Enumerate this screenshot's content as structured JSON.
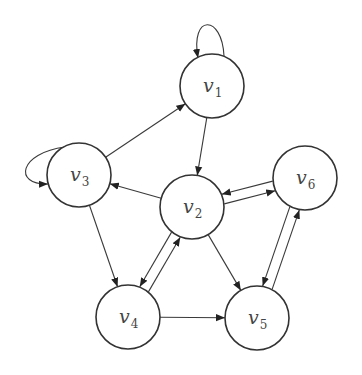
{
  "diagram": {
    "type": "directed-graph",
    "node_radius": 32,
    "nodes": [
      {
        "id": "v1",
        "base": "v",
        "sub": "1",
        "x": 212,
        "y": 86
      },
      {
        "id": "v2",
        "base": "v",
        "sub": "2",
        "x": 192,
        "y": 207
      },
      {
        "id": "v3",
        "base": "v",
        "sub": "3",
        "x": 79,
        "y": 175
      },
      {
        "id": "v4",
        "base": "v",
        "sub": "4",
        "x": 128,
        "y": 317
      },
      {
        "id": "v5",
        "base": "v",
        "sub": "5",
        "x": 257,
        "y": 318
      },
      {
        "id": "v6",
        "base": "v",
        "sub": "6",
        "x": 305,
        "y": 178
      }
    ],
    "edges": [
      {
        "from": "v1",
        "to": "v1",
        "self_loop": true
      },
      {
        "from": "v3",
        "to": "v3",
        "self_loop": true
      },
      {
        "from": "v3",
        "to": "v1"
      },
      {
        "from": "v1",
        "to": "v2"
      },
      {
        "from": "v2",
        "to": "v3"
      },
      {
        "from": "v3",
        "to": "v4"
      },
      {
        "from": "v2",
        "to": "v6"
      },
      {
        "from": "v6",
        "to": "v2"
      },
      {
        "from": "v4",
        "to": "v2"
      },
      {
        "from": "v2",
        "to": "v4"
      },
      {
        "from": "v2",
        "to": "v5"
      },
      {
        "from": "v4",
        "to": "v5"
      },
      {
        "from": "v5",
        "to": "v6"
      },
      {
        "from": "v6",
        "to": "v5"
      }
    ],
    "colors": {
      "stroke": "#333333",
      "fill": "#ffffff",
      "label": "#444444"
    }
  }
}
